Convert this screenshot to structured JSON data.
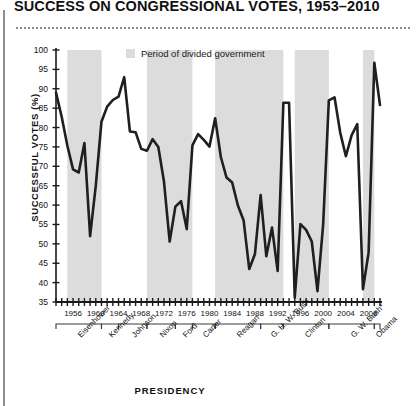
{
  "title": "SUCCESS ON CONGRESSIONAL VOTES, 1953–2010",
  "legend": {
    "label": "Period of divided government",
    "swatch_color": "#dcdcdc"
  },
  "axes": {
    "ylabel": "SUCCESSFUL VOTES (%)",
    "xlabel": "PRESIDENCY"
  },
  "chart_data": {
    "type": "line",
    "title": "SUCCESS ON CONGRESSIONAL VOTES, 1953–2010",
    "xlabel": "PRESIDENCY",
    "ylabel": "SUCCESSFUL VOTES (%)",
    "ylim": [
      35,
      100
    ],
    "yticks": [
      35,
      40,
      45,
      50,
      55,
      60,
      65,
      70,
      75,
      80,
      85,
      90,
      95,
      100
    ],
    "xlim": [
      1953,
      2010
    ],
    "xticks": [
      1956,
      1960,
      1964,
      1968,
      1972,
      1976,
      1980,
      1984,
      1988,
      1992,
      1996,
      2000,
      2004,
      2008
    ],
    "grid": false,
    "legend_position": "top-center",
    "line_color": "#1f1f1f",
    "line_width": 2.6,
    "series": [
      {
        "name": "Presidential success rate on congressional votes",
        "x": [
          1953,
          1954,
          1955,
          1956,
          1957,
          1958,
          1959,
          1960,
          1961,
          1962,
          1963,
          1964,
          1965,
          1966,
          1967,
          1968,
          1969,
          1970,
          1971,
          1972,
          1973,
          1974,
          1975,
          1976,
          1977,
          1978,
          1979,
          1980,
          1981,
          1982,
          1983,
          1984,
          1985,
          1986,
          1987,
          1988,
          1989,
          1990,
          1991,
          1992,
          1993,
          1994,
          1995,
          1996,
          1997,
          1998,
          1999,
          2000,
          2001,
          2002,
          2003,
          2004,
          2005,
          2006,
          2007,
          2008,
          2009,
          2010
        ],
        "y": [
          89.0,
          82.8,
          75.3,
          69.2,
          68.4,
          76.0,
          52.0,
          65.0,
          81.5,
          85.4,
          87.1,
          88.0,
          93.0,
          79.0,
          78.8,
          74.5,
          74.0,
          77.0,
          75.0,
          66.0,
          50.6,
          59.6,
          61.0,
          53.8,
          75.4,
          78.3,
          76.8,
          75.1,
          82.4,
          72.4,
          67.1,
          65.8,
          59.9,
          56.1,
          43.5,
          47.4,
          62.6,
          46.8,
          54.2,
          43.0,
          86.4,
          86.4,
          36.2,
          55.1,
          53.6,
          50.6,
          37.8,
          55.0,
          87.0,
          87.8,
          78.7,
          72.6,
          78.0,
          80.9,
          38.3,
          47.8,
          96.7,
          85.8
        ]
      }
    ],
    "shaded_bands": {
      "label": "Period of divided government",
      "color": "#dcdcdc",
      "ranges": [
        [
          1955,
          1961
        ],
        [
          1969,
          1977
        ],
        [
          1981,
          1993
        ],
        [
          1995,
          2001
        ],
        [
          2007,
          2009
        ]
      ]
    }
  },
  "presidents": [
    {
      "name": "Eisenhower",
      "start": 1953,
      "end": 1961
    },
    {
      "name": "Kennedy",
      "start": 1961,
      "end": 1964
    },
    {
      "name": "Johnson",
      "start": 1964,
      "end": 1969
    },
    {
      "name": "Nixon",
      "start": 1969,
      "end": 1974
    },
    {
      "name": "Ford",
      "start": 1974,
      "end": 1977
    },
    {
      "name": "Carter",
      "start": 1977,
      "end": 1981
    },
    {
      "name": "Reagan",
      "start": 1981,
      "end": 1989
    },
    {
      "name": "G. H. W. Bush",
      "start": 1989,
      "end": 1993
    },
    {
      "name": "Clinton",
      "start": 1993,
      "end": 2001
    },
    {
      "name": "G. W. Bush*",
      "start": 2001,
      "end": 2009
    },
    {
      "name": "Obama",
      "start": 2009,
      "end": 2011
    }
  ]
}
